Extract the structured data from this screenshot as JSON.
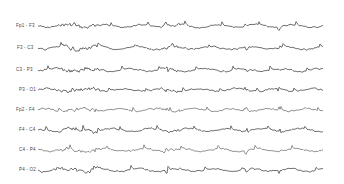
{
  "chart_data": {
    "type": "line",
    "title": "",
    "xlabel": "",
    "ylabel": "",
    "grid": false,
    "legend": "none",
    "channels": [
      {
        "label": "Fp1 - F3",
        "baseline_y": 26
      },
      {
        "label": "F3 - C3",
        "baseline_y": 48
      },
      {
        "label": "C3 - P3",
        "baseline_y": 70
      },
      {
        "label": "P3 - O1",
        "baseline_y": 90
      },
      {
        "label": "Fp2 - F4",
        "baseline_y": 110
      },
      {
        "label": "F4 - C4",
        "baseline_y": 130
      },
      {
        "label": "C4 - P4",
        "baseline_y": 150
      },
      {
        "label": "P4 - O2",
        "baseline_y": 170
      }
    ],
    "trace_color": "#333333"
  },
  "channels": [
    {
      "label": "Fp1 - F3"
    },
    {
      "label": "F3 - C3"
    },
    {
      "label": "C3 - P3"
    },
    {
      "label": "P3 - O1"
    },
    {
      "label": "Fp2 - F4"
    },
    {
      "label": "F4 - C4"
    },
    {
      "label": "C4 - P4"
    },
    {
      "label": "P4 - O2"
    }
  ]
}
